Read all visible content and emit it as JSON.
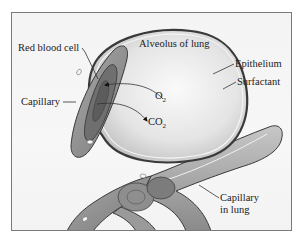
{
  "figure": {
    "labels": {
      "red_blood_cell": "Red blood cell",
      "alveolus": "Alveolus of lung",
      "epithelium": "Epithelium",
      "surfactant": "Surfactant",
      "capillary": "Capillary",
      "o2": "O",
      "o2_sub": "2",
      "co2": "CO",
      "co2_sub": "2",
      "capillary_in_lung_line1": "Capillary",
      "capillary_in_lung_line2": "in lung"
    },
    "arrows": [
      {
        "name": "o2-arrow",
        "from": "alveolus",
        "to": "red-blood-cell"
      },
      {
        "name": "co2-arrow",
        "from": "red-blood-cell",
        "to": "alveolus"
      }
    ],
    "colors": {
      "frame_border": "#7a7a7a",
      "background": "#f5f5f5",
      "capillary_gray": "#8d8d8d",
      "rbc_dark": "#6e6e6e",
      "alveolus_fill": "#e6e6e6",
      "outline": "#3a3a3a"
    }
  }
}
